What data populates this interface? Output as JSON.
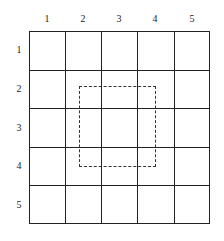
{
  "grid": {
    "rows": 5,
    "cols": 5,
    "column_labels": [
      "1",
      "2",
      "3",
      "4",
      "5"
    ],
    "row_labels": [
      "1",
      "2",
      "3",
      "4",
      "5"
    ]
  },
  "selection": {
    "style": "dashed",
    "description": "dashed rectangle spanning roughly columns 2.4-4.4, rows 2.4-4.4"
  }
}
